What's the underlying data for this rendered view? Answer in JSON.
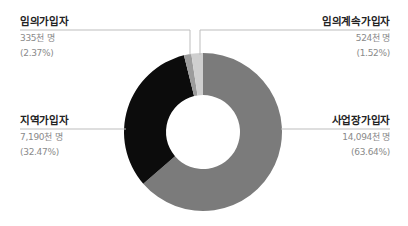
{
  "chart_data": {
    "type": "pie",
    "donut": true,
    "title": "",
    "categories": [
      "사업장가입자",
      "지역가입자",
      "임의가입자",
      "임의계속가입자"
    ],
    "values": [
      14094,
      7190,
      335,
      524
    ],
    "unit": "천 명",
    "percentages": [
      63.64,
      32.47,
      2.37,
      1.52
    ],
    "colors": [
      "#7b7b7b",
      "#0c0c0c",
      "#9c9c9c",
      "#cfcfcf"
    ],
    "legend_position": "callout labels"
  },
  "labels": {
    "voluntary": {
      "title": "임의가입자",
      "count": "335천 명",
      "pct": "(2.37%)"
    },
    "voluntary_continued": {
      "title": "임의계속가입자",
      "count": "524천 명",
      "pct": "(1.52%)"
    },
    "regional": {
      "title": "지역가입자",
      "count": "7,190천 명",
      "pct": "(32.47%)"
    },
    "workplace": {
      "title": "사업장가입자",
      "count": "14,094천 명",
      "pct": "(63.64%)"
    }
  }
}
